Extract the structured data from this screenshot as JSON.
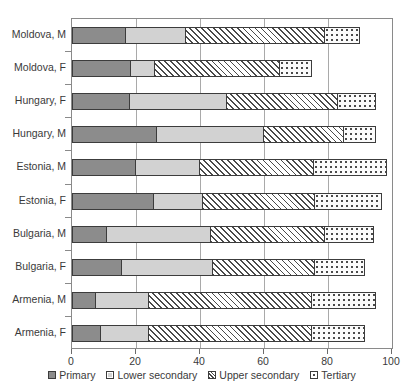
{
  "chart_data": {
    "type": "bar",
    "orientation": "horizontal",
    "stacked": true,
    "title": "",
    "xlabel": "",
    "ylabel": "",
    "xlim": [
      0,
      100
    ],
    "xticks": [
      0,
      20,
      40,
      60,
      80,
      100
    ],
    "xticklabels": [
      "0",
      "20",
      "40",
      "60",
      "80",
      "100"
    ],
    "grid": "vertical",
    "legend_position": "bottom",
    "categories": [
      "Moldova, M",
      "Moldova, F",
      "Hungary, F",
      "Hungary, M",
      "Estonia, M",
      "Estonia, F",
      "Bulgaria, M",
      "Bulgaria, F",
      "Armenia, M",
      "Armenia, F"
    ],
    "series": [
      {
        "name": "Primary",
        "color": "#8c8c8c",
        "pattern": "solid-gray",
        "values": [
          17,
          18.5,
          18,
          26.5,
          20,
          25.5,
          11,
          15.5,
          7.5,
          9
        ]
      },
      {
        "name": "Lower secondary",
        "color": "#d2d2d2",
        "pattern": "solid-light",
        "values": [
          18.5,
          7.5,
          30.5,
          33.5,
          20,
          15.5,
          32.5,
          28.5,
          16.5,
          15
        ]
      },
      {
        "name": "Upper secondary",
        "color": "#ffffff",
        "pattern": "diagonal-hatch",
        "values": [
          43.5,
          39,
          34.5,
          25,
          35.5,
          35,
          35.5,
          32,
          51,
          51
        ]
      },
      {
        "name": "Tertiary",
        "color": "#fbfbfb",
        "pattern": "dotted",
        "values": [
          11,
          10,
          12,
          10,
          23,
          21,
          15.5,
          15.5,
          20,
          16.5
        ]
      }
    ],
    "totals": [
      90,
      75,
      95,
      95,
      98.5,
      97,
      94.5,
      91.5,
      95,
      91.5
    ]
  }
}
